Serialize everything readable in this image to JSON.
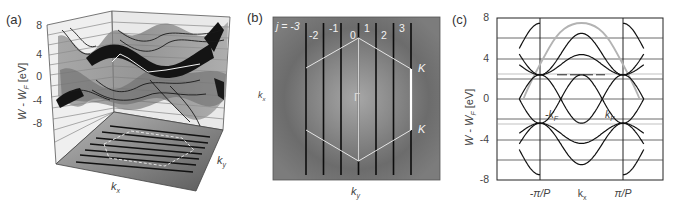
{
  "figure": {
    "panels": [
      {
        "id": "a",
        "label": "(a)",
        "type": "3d-surface",
        "ylabel_main": "W - W",
        "ylabel_sub": "F",
        "ylabel_unit": " [eV]",
        "yticks": [
          "8",
          "4",
          "0",
          "-4",
          "-8"
        ],
        "xlabel": "k",
        "xlabel_sub": "x",
        "zlabel": "k",
        "zlabel_sub": "y"
      },
      {
        "id": "b",
        "label": "(b)",
        "type": "reciprocal-space-map",
        "j_prefix": "j = -3",
        "j_labels": [
          "-2",
          "-1",
          "0",
          "1",
          "2",
          "3"
        ],
        "center_label": "Γ",
        "corner_labels": [
          "K",
          "K"
        ],
        "xlabel": "k",
        "xlabel_sub": "y",
        "ylabel": "k",
        "ylabel_sub": "x"
      },
      {
        "id": "c",
        "label": "(c)",
        "type": "band-structure",
        "ylabel_main": "W - W",
        "ylabel_sub": "F",
        "ylabel_unit": " [eV]",
        "yticks": [
          "8",
          "4",
          "0",
          "-4",
          "-8"
        ],
        "xticks": [
          "-π/P",
          "k",
          "π/P"
        ],
        "xtick_mid_sub": "x",
        "annotations": [
          "-k",
          "k"
        ],
        "annotation_sub": "F"
      }
    ]
  },
  "chart_data": [
    {
      "type": "surface",
      "title": "(a)",
      "xlabel": "k_x",
      "ylabel": "W - W_F [eV]",
      "zlabel": "k_y",
      "ylim": [
        -8,
        8
      ],
      "yticks": [
        8,
        4,
        0,
        -4,
        -8
      ],
      "notes": "3D energy surfaces over the hexagonal Brillouin zone, with its projection on the k_x-k_y floor and allowed k-lines"
    },
    {
      "type": "heatmap",
      "title": "(b)",
      "xlabel": "k_y",
      "ylabel": "k_x",
      "lines_j": [
        -3,
        -2,
        -1,
        0,
        1,
        2,
        3
      ],
      "points": [
        "Γ",
        "K",
        "K"
      ],
      "notes": "Hexagonal Brillouin zone with 7 vertical allowed k-lines j=-3..3 over a radial energy gradient"
    },
    {
      "type": "line",
      "title": "(c)",
      "xlabel": "k_x",
      "ylabel": "W - W_F [eV]",
      "ylim": [
        -8,
        8
      ],
      "yticks": [
        -8,
        -4,
        0,
        4,
        8
      ],
      "xticks": [
        "-π/P",
        "k_x",
        "π/P"
      ],
      "x_range_units_pi_over_P": [
        -1.5,
        1.5
      ],
      "series": [
        {
          "name": "band+1",
          "formula": "4.45 + 2.05 cos(πk)",
          "at_0": 6.5,
          "at_pm1": 2.4
        },
        {
          "name": "band+2",
          "formula": "3.4 + 1.0 cos(πk)",
          "at_0": 4.4,
          "at_pm1": 2.4
        },
        {
          "name": "band+3",
          "formula": "-2.4 cos(πk)",
          "at_0": -2.4,
          "at_pm1": 2.4
        },
        {
          "name": "band-3",
          "formula": "2.4 cos(πk)",
          "at_0": 2.4,
          "at_pm1": -2.4
        },
        {
          "name": "band-2",
          "formula": "-3.4 - 1.0 cos(πk)",
          "at_0": -4.4,
          "at_pm1": -2.4
        },
        {
          "name": "band-1",
          "formula": "-4.45 - 2.05 cos(πk)",
          "at_0": -6.5,
          "at_pm1": -2.4
        },
        {
          "name": "gray-unfolded",
          "formula": "7.5 cos(πk/2.8)",
          "at_0": 7.5,
          "zero_crossings": [
            -1.4,
            1.4
          ]
        },
        {
          "name": "dashed-level",
          "value": 2.4
        }
      ],
      "annotations": [
        "-k_F",
        "k_F"
      ],
      "grid": true
    }
  ]
}
